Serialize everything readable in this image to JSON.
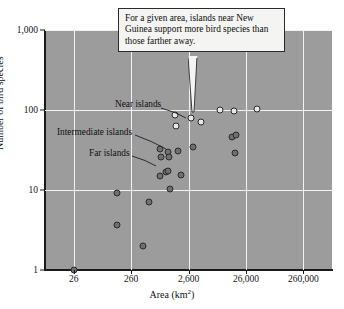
{
  "chart_data": {
    "type": "scatter",
    "title": "",
    "xlabel": "Area (km2)",
    "ylabel": "Number of bird species",
    "xscale": "log",
    "yscale": "log",
    "xlim": [
      8.2,
      820000
    ],
    "ylim": [
      1,
      1000
    ],
    "grid": true,
    "xticks": [
      "26",
      "260",
      "2,600",
      "26,000",
      "260,000"
    ],
    "xtick_values": [
      26,
      260,
      2600,
      26000,
      260000
    ],
    "yticks": [
      "1",
      "10",
      "100",
      "1,000"
    ],
    "ytick_values": [
      1,
      10,
      100,
      1000
    ],
    "legend_position": "none",
    "series": [
      {
        "name": "Near islands",
        "marker": "open-circle",
        "color": "#e8e8e8",
        "edge_color": "#2a2a2a",
        "points": [
          {
            "x": 1500,
            "y": 86
          },
          {
            "x": 1600,
            "y": 63
          },
          {
            "x": 2900,
            "y": 80
          },
          {
            "x": 4300,
            "y": 70
          },
          {
            "x": 9200,
            "y": 100
          },
          {
            "x": 16000,
            "y": 97
          },
          {
            "x": 41000,
            "y": 104
          }
        ]
      },
      {
        "name": "Intermediate islands",
        "marker": "filled-circle",
        "color": "#6f6f6f",
        "edge_color": "#2b2b2b",
        "points": [
          {
            "x": 820,
            "y": 33
          },
          {
            "x": 860,
            "y": 26
          },
          {
            "x": 1150,
            "y": 30
          },
          {
            "x": 1180,
            "y": 26
          },
          {
            "x": 1700,
            "y": 31
          },
          {
            "x": 3100,
            "y": 34
          },
          {
            "x": 15000,
            "y": 46
          },
          {
            "x": 17500,
            "y": 49
          },
          {
            "x": 17000,
            "y": 29
          }
        ]
      },
      {
        "name": "Far islands",
        "marker": "filled-circle",
        "color": "#6f6f6f",
        "edge_color": "#2b2b2b",
        "points": [
          {
            "x": 26,
            "y": 1
          },
          {
            "x": 150,
            "y": 9.2
          },
          {
            "x": 145,
            "y": 3.7
          },
          {
            "x": 420,
            "y": 2.0
          },
          {
            "x": 530,
            "y": 7.0
          },
          {
            "x": 820,
            "y": 15
          },
          {
            "x": 1050,
            "y": 17
          },
          {
            "x": 1150,
            "y": 17.5
          },
          {
            "x": 1250,
            "y": 10.3
          },
          {
            "x": 1900,
            "y": 15.5
          }
        ]
      }
    ],
    "annotations": [
      {
        "id": "near",
        "text": "Near islands"
      },
      {
        "id": "intermediate",
        "text": "Intermediate islands"
      },
      {
        "id": "far",
        "text": "Far islands"
      }
    ]
  },
  "callout": {
    "text": "For a given area, islands near New Guinea support more bird species than those farther away."
  },
  "axes": {
    "x_title_main": "Area (km",
    "x_title_sup": "2",
    "x_title_end": ")",
    "y_title": "Number of bird species"
  }
}
